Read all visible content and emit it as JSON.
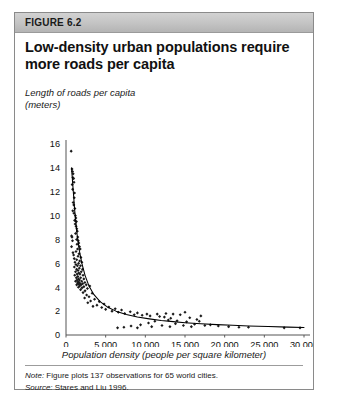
{
  "figure": {
    "label": "FIGURE 6.2",
    "title": "Low-density urban populations require more roads per capita",
    "note_lead": "Note:",
    "note_text": " Figure plots 137 observations for 65 world cities.",
    "source_lead": "Source:",
    "source_text": " Stares and Liu 1996.",
    "header_bg": "#c3c3c3",
    "border_color": "#8a8a8a",
    "marker_color": "#1a1a1a",
    "curve_color": "#000000"
  },
  "chart_data": {
    "type": "scatter",
    "title": "Low-density urban populations require more roads per capita",
    "ylabel": "Length of roads per capita (meters)",
    "ylabel_line1": "Length of roads per capita",
    "ylabel_line2": "(meters)",
    "xlabel": "Population density (people per square kilometer)",
    "xlim": [
      0,
      30000
    ],
    "ylim": [
      0,
      16
    ],
    "xticks": [
      0,
      5000,
      10000,
      15000,
      20000,
      25000,
      30000
    ],
    "xticklabels": [
      "0",
      "5,000",
      "10,000",
      "15,000",
      "20,000",
      "25,000",
      "30,000"
    ],
    "yticks": [
      0,
      2,
      4,
      6,
      8,
      10,
      12,
      14,
      16
    ],
    "yticklabels": [
      "0",
      "2",
      "4",
      "6",
      "8",
      "10",
      "12",
      "14",
      "16"
    ],
    "grid": false,
    "legend": null,
    "n_observations": 137,
    "n_cities": 65,
    "points": [
      [
        650,
        15.4
      ],
      [
        760,
        13.9
      ],
      [
        820,
        13.7
      ],
      [
        900,
        13.5
      ],
      [
        870,
        13.2
      ],
      [
        960,
        13.1
      ],
      [
        1010,
        12.8
      ],
      [
        780,
        12.6
      ],
      [
        840,
        12.2
      ],
      [
        1080,
        11.9
      ],
      [
        1040,
        11.5
      ],
      [
        900,
        11.1
      ],
      [
        980,
        10.9
      ],
      [
        1120,
        10.6
      ],
      [
        860,
        10.4
      ],
      [
        1000,
        10.2
      ],
      [
        1180,
        10.0
      ],
      [
        1240,
        9.8
      ],
      [
        1090,
        9.6
      ],
      [
        1310,
        9.5
      ],
      [
        1150,
        9.3
      ],
      [
        1270,
        9.1
      ],
      [
        1360,
        8.9
      ],
      [
        1420,
        8.7
      ],
      [
        1200,
        8.5
      ],
      [
        700,
        8.3
      ],
      [
        760,
        8.2
      ],
      [
        1480,
        8.2
      ],
      [
        1330,
        8.0
      ],
      [
        820,
        7.9
      ],
      [
        1550,
        7.9
      ],
      [
        1610,
        7.7
      ],
      [
        1390,
        7.6
      ],
      [
        700,
        7.4
      ],
      [
        1700,
        7.4
      ],
      [
        1450,
        7.2
      ],
      [
        1790,
        7.2
      ],
      [
        1260,
        7.0
      ],
      [
        880,
        6.9
      ],
      [
        1640,
        6.8
      ],
      [
        960,
        6.7
      ],
      [
        1520,
        6.6
      ],
      [
        1880,
        6.5
      ],
      [
        1040,
        6.4
      ],
      [
        1350,
        6.3
      ],
      [
        1720,
        6.2
      ],
      [
        1130,
        6.1
      ],
      [
        2000,
        6.1
      ],
      [
        1580,
        6.0
      ],
      [
        1250,
        5.9
      ],
      [
        1440,
        5.8
      ],
      [
        1830,
        5.8
      ],
      [
        1050,
        5.7
      ],
      [
        1680,
        5.6
      ],
      [
        1340,
        5.5
      ],
      [
        2080,
        5.5
      ],
      [
        1520,
        5.4
      ],
      [
        1200,
        5.3
      ],
      [
        1920,
        5.3
      ],
      [
        1620,
        5.2
      ],
      [
        1400,
        5.1
      ],
      [
        1760,
        5.1
      ],
      [
        1100,
        5.0
      ],
      [
        2150,
        5.0
      ],
      [
        1490,
        4.9
      ],
      [
        1300,
        4.8
      ],
      [
        1850,
        4.8
      ],
      [
        1570,
        4.7
      ],
      [
        2250,
        4.7
      ],
      [
        1390,
        4.6
      ],
      [
        1700,
        4.6
      ],
      [
        1200,
        4.5
      ],
      [
        1980,
        4.5
      ],
      [
        1520,
        4.45
      ],
      [
        1640,
        4.4
      ],
      [
        2380,
        4.4
      ],
      [
        1450,
        4.35
      ],
      [
        1780,
        4.3
      ],
      [
        2100,
        4.3
      ],
      [
        1600,
        4.25
      ],
      [
        1350,
        4.2
      ],
      [
        1900,
        4.2
      ],
      [
        2550,
        4.2
      ],
      [
        1720,
        4.1
      ],
      [
        2250,
        4.05
      ],
      [
        3000,
        4.1
      ],
      [
        1560,
        4.0
      ],
      [
        2020,
        3.95
      ],
      [
        2700,
        3.9
      ],
      [
        1840,
        3.8
      ],
      [
        2400,
        3.7
      ],
      [
        2150,
        3.55
      ],
      [
        3300,
        3.5
      ],
      [
        2600,
        3.35
      ],
      [
        2900,
        3.2
      ],
      [
        2350,
        3.1
      ],
      [
        3600,
        3.0
      ],
      [
        3100,
        2.85
      ],
      [
        4200,
        2.8
      ],
      [
        2750,
        2.7
      ],
      [
        4800,
        2.6
      ],
      [
        3900,
        2.5
      ],
      [
        3400,
        2.4
      ],
      [
        5400,
        2.35
      ],
      [
        4500,
        2.3
      ],
      [
        6200,
        2.2
      ],
      [
        5000,
        2.15
      ],
      [
        7000,
        2.1
      ],
      [
        5800,
        2.0
      ],
      [
        8100,
        1.95
      ],
      [
        6600,
        1.9
      ],
      [
        9000,
        1.85
      ],
      [
        7400,
        1.8
      ],
      [
        10200,
        1.75
      ],
      [
        8600,
        1.7
      ],
      [
        11500,
        1.75
      ],
      [
        9600,
        1.65
      ],
      [
        12600,
        1.8
      ],
      [
        10600,
        1.6
      ],
      [
        13500,
        1.75
      ],
      [
        11800,
        1.55
      ],
      [
        14400,
        1.7
      ],
      [
        12400,
        1.5
      ],
      [
        15600,
        1.45
      ],
      [
        13200,
        1.4
      ],
      [
        16500,
        1.3
      ],
      [
        12900,
        1.25
      ],
      [
        14000,
        1.2
      ],
      [
        11200,
        1.15
      ],
      [
        15200,
        1.1
      ],
      [
        10400,
        1.0
      ],
      [
        13800,
        0.95
      ],
      [
        16200,
        0.9
      ],
      [
        9400,
        0.85
      ],
      [
        12100,
        0.8
      ],
      [
        14800,
        0.8
      ],
      [
        17500,
        0.8
      ],
      [
        8200,
        0.75
      ],
      [
        10800,
        0.7
      ],
      [
        13100,
        0.7
      ],
      [
        15800,
        0.7
      ],
      [
        19200,
        0.75
      ],
      [
        20500,
        0.7
      ],
      [
        21800,
        0.65
      ],
      [
        23000,
        0.65
      ],
      [
        27500,
        0.6
      ],
      [
        29500,
        0.6
      ],
      [
        7300,
        0.65
      ],
      [
        9000,
        0.6
      ],
      [
        6500,
        0.6
      ],
      [
        18200,
        0.85
      ],
      [
        17000,
        1.6
      ],
      [
        15000,
        1.9
      ],
      [
        16800,
        1.15
      ]
    ],
    "fit_curve": {
      "description": "declining power/inverse fit through the scatter",
      "x": [
        700,
        900,
        1100,
        1400,
        1700,
        2000,
        2400,
        2900,
        3500,
        4300,
        5200,
        6300,
        7600,
        9000,
        10500,
        12000,
        13500,
        15000,
        17000,
        19000,
        21000,
        23000,
        25500,
        28000,
        30000
      ],
      "y": [
        14.0,
        12.2,
        10.4,
        8.4,
        7.0,
        6.0,
        5.0,
        4.1,
        3.4,
        2.8,
        2.35,
        2.0,
        1.72,
        1.5,
        1.35,
        1.22,
        1.12,
        1.03,
        0.94,
        0.87,
        0.81,
        0.76,
        0.71,
        0.66,
        0.63
      ]
    }
  }
}
